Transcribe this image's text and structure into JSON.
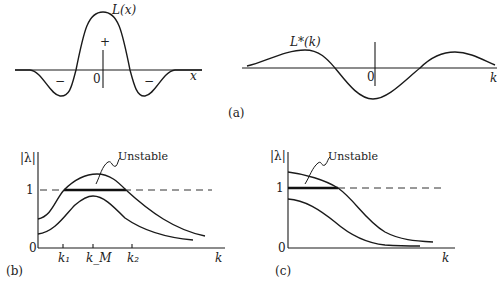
{
  "panels": {
    "a": {
      "label": "(a)",
      "left": {
        "curve_label": "L(x)",
        "origin": "0",
        "axis": "x",
        "plus": "+",
        "minus_left": "−",
        "minus_right": "−"
      },
      "right": {
        "curve_label": "L*(k)",
        "origin": "0",
        "axis": "k"
      }
    },
    "b": {
      "label": "(b)",
      "ylabel": "|λ|",
      "y_one": "1",
      "y_zero": "0",
      "annotation": "Unstable",
      "ticks": {
        "k1": "k₁",
        "kM": "k_M",
        "k2": "k₂"
      },
      "xlabel": "k"
    },
    "c": {
      "label": "(c)",
      "ylabel": "|λ|",
      "y_one": "1",
      "y_zero": "0",
      "annotation": "Unstable",
      "xlabel": "k"
    }
  },
  "colors": {
    "ink": "#1a1a1a",
    "background": "#ffffff"
  }
}
